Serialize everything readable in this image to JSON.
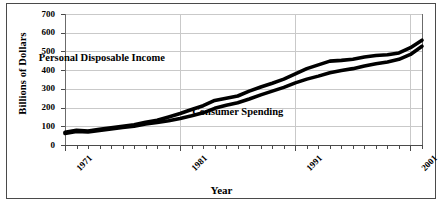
{
  "chart_data": {
    "type": "line",
    "title": "",
    "xlabel": "Year",
    "ylabel": "Billions of Dollars",
    "xlim": [
      1971,
      2002
    ],
    "ylim": [
      0,
      700
    ],
    "ytick_values": [
      0,
      100,
      200,
      300,
      400,
      500,
      600,
      700
    ],
    "ytick_labels": [
      "0",
      "100",
      "200",
      "300",
      "400",
      "500",
      "600",
      "700"
    ],
    "xtick_major_values": [
      1971,
      1981,
      1991,
      2001
    ],
    "xtick_major_labels": [
      "1971",
      "1981",
      "1991",
      "2001"
    ],
    "grid": true,
    "legend_position": "inline-annotation",
    "x": [
      1971,
      1972,
      1973,
      1974,
      1975,
      1976,
      1977,
      1978,
      1979,
      1980,
      1981,
      1982,
      1983,
      1984,
      1985,
      1986,
      1987,
      1988,
      1989,
      1990,
      1991,
      1992,
      1993,
      1994,
      1995,
      1996,
      1997,
      1998,
      1999,
      2000,
      2001,
      2002
    ],
    "series": [
      {
        "name": "Personal Disposable Income",
        "values": [
          68,
          78,
          74,
          84,
          92,
          100,
          108,
          122,
          132,
          150,
          168,
          190,
          210,
          238,
          250,
          262,
          288,
          310,
          330,
          352,
          380,
          408,
          428,
          448,
          452,
          458,
          470,
          478,
          482,
          492,
          520,
          560
        ]
      },
      {
        "name": "Consumer Spending",
        "values": [
          62,
          72,
          70,
          78,
          86,
          94,
          100,
          112,
          120,
          130,
          142,
          156,
          172,
          196,
          212,
          226,
          246,
          268,
          288,
          308,
          332,
          352,
          368,
          386,
          398,
          408,
          422,
          434,
          444,
          458,
          484,
          528
        ]
      }
    ],
    "annotations": [
      {
        "text": "Personal Disposable Income",
        "x": 1974.2,
        "y": 465
      },
      {
        "text": "Consumer Spending",
        "x": 1986.0,
        "y": 175
      }
    ],
    "line_color": "#000000"
  }
}
